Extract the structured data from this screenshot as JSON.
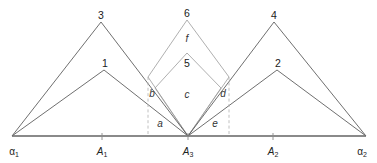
{
  "figure": {
    "background_color": "#ffffff",
    "line_color_dark": "#4a4a4a",
    "line_color_light": "#9a9a9a",
    "baseline_color": "#8a8a8a",
    "dash_color": "#b0b0b0",
    "text_color": "#222222"
  },
  "apex_labels": [
    {
      "id": "apex-3",
      "text": "3",
      "x": 101,
      "y": 16
    },
    {
      "id": "apex-1",
      "text": "1",
      "x": 105,
      "y": 64
    },
    {
      "id": "apex-6",
      "text": "6",
      "x": 187,
      "y": 14
    },
    {
      "id": "apex-5",
      "text": "5",
      "x": 187,
      "y": 64
    },
    {
      "id": "apex-4",
      "text": "4",
      "x": 274,
      "y": 16
    },
    {
      "id": "apex-2",
      "text": "2",
      "x": 278,
      "y": 64
    }
  ],
  "region_labels": [
    {
      "id": "region-f",
      "text": "f",
      "x": 187,
      "y": 39
    },
    {
      "id": "region-b",
      "text": "b",
      "x": 152,
      "y": 94
    },
    {
      "id": "region-c",
      "text": "c",
      "x": 187,
      "y": 95
    },
    {
      "id": "region-d",
      "text": "d",
      "x": 223,
      "y": 94
    },
    {
      "id": "region-a",
      "text": "a",
      "x": 160,
      "y": 124
    },
    {
      "id": "region-e",
      "text": "e",
      "x": 215,
      "y": 124
    }
  ],
  "axis_labels": [
    {
      "id": "axis-alpha1",
      "base": "α",
      "sub": "1",
      "x": 14,
      "y": 152
    },
    {
      "id": "axis-A1",
      "base": "A",
      "sub": "1",
      "x": 102,
      "y": 152
    },
    {
      "id": "axis-A3",
      "base": "A",
      "sub": "3",
      "x": 188,
      "y": 152
    },
    {
      "id": "axis-A2",
      "base": "A",
      "sub": "2",
      "x": 273,
      "y": 152
    },
    {
      "id": "axis-alpha2",
      "base": "α",
      "sub": "2",
      "x": 362,
      "y": 152
    }
  ],
  "geometry": {
    "baseline": {
      "x1": 12,
      "y1": 136,
      "x2": 366,
      "y2": 136
    },
    "ticks": [
      {
        "id": "tick-A1",
        "x": 102,
        "y1": 133,
        "y2": 140
      },
      {
        "id": "tick-A3",
        "x": 188,
        "y1": 133,
        "y2": 140
      },
      {
        "id": "tick-A2",
        "x": 273,
        "y1": 133,
        "y2": 140
      }
    ],
    "triangle_3": {
      "points": "12,136 101,22 188,136",
      "stroke": "#4a4a4a"
    },
    "triangle_1": {
      "points": "12,136 104,70 188,136",
      "stroke": "#4a4a4a"
    },
    "triangle_4": {
      "points": "188,136 274,22 366,136",
      "stroke": "#4a4a4a"
    },
    "triangle_2": {
      "points": "188,136 277,70 366,136",
      "stroke": "#4a4a4a"
    },
    "rhombus_6": {
      "points": "188,136 148,77 187,20 229,77",
      "stroke": "#9a9a9a"
    },
    "rhombus_5": {
      "points": "188,136 155,88 187,53 221,88",
      "stroke": "#9a9a9a"
    },
    "dashed_left": {
      "x": 148,
      "y1": 77,
      "y2": 136
    },
    "dashed_right": {
      "x": 229,
      "y1": 77,
      "y2": 136
    }
  }
}
